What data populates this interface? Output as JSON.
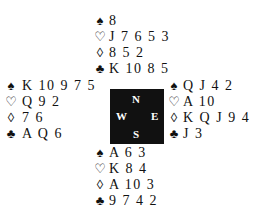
{
  "symbols": {
    "spades": "♠",
    "hearts": "♡",
    "diamonds": "◊",
    "clubs": "♣"
  },
  "compass": {
    "north": "N",
    "south": "S",
    "west": "W",
    "east": "E"
  },
  "hands": {
    "north": {
      "spades": "8",
      "hearts": "J 7 6 5 3",
      "diamonds": "8 5 2",
      "clubs": "K 10 8 5"
    },
    "west": {
      "spades": "K 10 9 7 5",
      "hearts": "Q 9 2",
      "diamonds": "7 6",
      "clubs": "A Q 6"
    },
    "east": {
      "spades": "Q J 4 2",
      "hearts": "A 10",
      "diamonds": "K Q J 9 4",
      "clubs": "J 3"
    },
    "south": {
      "spades": "A 6 3",
      "hearts": "K 8 4",
      "diamonds": "A 10 3",
      "clubs": "9 7 4 2"
    }
  }
}
